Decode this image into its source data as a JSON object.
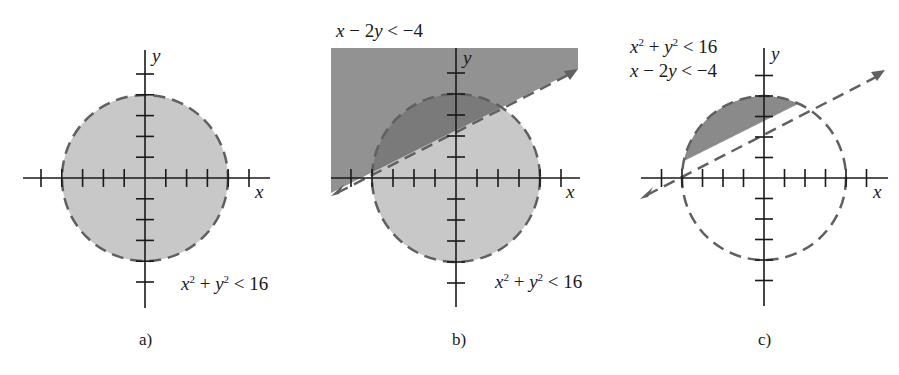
{
  "figure": {
    "panels": [
      {
        "id": "a",
        "caption": "a)",
        "axis_x_label": "x",
        "axis_y_label": "y",
        "inequalities": [
          "x² + y² < 16"
        ],
        "label_parts": {
          "x": "x",
          "sq": "2",
          "plus": " + ",
          "y": "y",
          "rest": " < 16"
        },
        "shading": "interior of circle radius 4 (light gray)"
      },
      {
        "id": "b",
        "caption": "b)",
        "axis_x_label": "x",
        "axis_y_label": "y",
        "inequalities": [
          "x − 2y < −4",
          "x² + y² < 16"
        ],
        "line_label_parts": {
          "x": "x",
          "mid": " − 2",
          "y": "y",
          "rest": " < −4"
        },
        "circle_label_parts": {
          "x": "x",
          "sq": "2",
          "plus": " + ",
          "y": "y",
          "rest": " < 16"
        },
        "shading": "half-plane above line (dark gray) overlapping circle (light gray)"
      },
      {
        "id": "c",
        "caption": "c)",
        "axis_x_label": "x",
        "axis_y_label": "y",
        "inequalities": [
          "x² + y² < 16",
          "x − 2y < −4"
        ],
        "circle_label_parts": {
          "x": "x",
          "sq": "2",
          "plus": " + ",
          "y": "y",
          "rest": " < 16"
        },
        "line_label_parts": {
          "x": "x",
          "mid": " − 2",
          "y": "y",
          "rest": " < −4"
        },
        "shading": "intersection region (dark gray) only"
      }
    ],
    "colors": {
      "light_fill": "#c8c8c8",
      "dark_fill": "#8a8a8a",
      "overlap_fill": "#7a7a7a",
      "dash": "#606060",
      "axis": "#1a1a1a"
    },
    "geometry": {
      "circle_radius_units": 4,
      "line": "x - 2y = -4 (passes through (-4,0) and (0,2))",
      "tick_range": [
        -5,
        5
      ]
    }
  }
}
